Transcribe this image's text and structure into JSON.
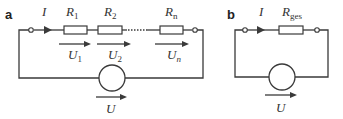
{
  "panels": {
    "a": {
      "label": "a",
      "current_symbol": "I",
      "resistors": [
        {
          "symbol": "R",
          "subscript": "1"
        },
        {
          "symbol": "R",
          "subscript": "2"
        },
        {
          "symbol": "R",
          "subscript": "n"
        }
      ],
      "voltages": [
        {
          "symbol": "U",
          "subscript": "1"
        },
        {
          "symbol": "U",
          "subscript": "2"
        },
        {
          "symbol": "U",
          "subscript": "n"
        }
      ],
      "source_voltage": "U"
    },
    "b": {
      "label": "b",
      "current_symbol": "I",
      "resistor": {
        "symbol": "R",
        "subscript": "ges"
      },
      "source_voltage": "U"
    }
  },
  "colors": {
    "line": "#3a3a3a",
    "background": "#ffffff"
  }
}
